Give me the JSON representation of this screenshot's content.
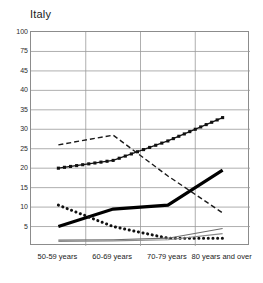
{
  "chart_data": {
    "type": "line",
    "title": "Italy",
    "xlabel": "",
    "ylabel": "",
    "grid": true,
    "legend_position": "none",
    "categories": [
      "50-59 years",
      "60-69 years",
      "70-79 years",
      "80 years and over"
    ],
    "ytick_labels": [
      "100",
      "75",
      "45",
      "40",
      "35",
      "30",
      "25",
      "20",
      "15",
      "10",
      "5"
    ],
    "ylim": [
      0,
      100
    ],
    "series": [
      {
        "name": "square-marker-line",
        "style": "solid-with-square-markers",
        "color": "#111111",
        "values": [
          20,
          22,
          27,
          33
        ]
      },
      {
        "name": "dashed-line",
        "style": "dashed",
        "color": "#1a1a1a",
        "values": [
          26,
          28.5,
          18,
          8.5
        ]
      },
      {
        "name": "thick-solid-line",
        "style": "thick-solid",
        "color": "#000000",
        "values": [
          5,
          9.5,
          10.5,
          19.5
        ]
      },
      {
        "name": "dotted-line",
        "style": "dotted",
        "color": "#111111",
        "values": [
          10.5,
          5,
          2,
          2
        ]
      },
      {
        "name": "thin-gray-line-upper",
        "style": "thin-solid",
        "color": "#6e6e6e",
        "values": [
          1.5,
          1.6,
          2,
          4.5
        ]
      },
      {
        "name": "thin-gray-line-lower",
        "style": "thin-solid",
        "color": "#8a8a8a",
        "values": [
          1.2,
          1.3,
          1.6,
          3.2
        ]
      }
    ]
  }
}
